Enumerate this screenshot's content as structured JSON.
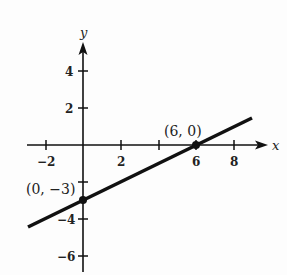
{
  "graph": {
    "x_axis_label": "x",
    "y_axis_label": "y",
    "x_ticks": [
      {
        "value": -2,
        "label": "−2"
      },
      {
        "value": 2,
        "label": "2"
      },
      {
        "value": 4,
        "label": ""
      },
      {
        "value": 6,
        "label": "6"
      },
      {
        "value": 8,
        "label": "8"
      }
    ],
    "y_ticks": [
      {
        "value": 4,
        "label": "4"
      },
      {
        "value": 2,
        "label": "2"
      },
      {
        "value": -2,
        "label": ""
      },
      {
        "value": -4,
        "label": "−4"
      },
      {
        "value": -6,
        "label": "−6"
      }
    ],
    "points": [
      {
        "label": "(0, −3)",
        "x": 0,
        "y": -3
      },
      {
        "label": "(6, 0)",
        "x": 6,
        "y": 0
      }
    ],
    "line": {
      "equation": "y = x/2 - 3",
      "x_start": -3,
      "y_start": -4.5,
      "x_end": 9,
      "y_end": 1.5
    },
    "colors": {
      "ink": "#111111",
      "background": "#fdfdfd"
    }
  }
}
